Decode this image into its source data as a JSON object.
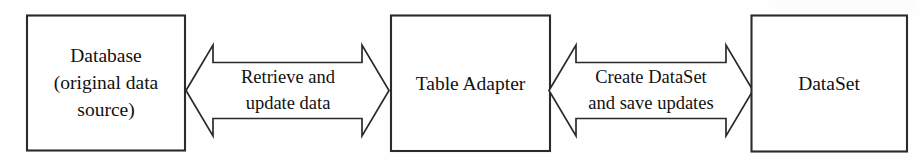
{
  "diagram": {
    "type": "block-flow",
    "orientation": "horizontal",
    "colors": {
      "background": "#fefefe",
      "shape_fill": "#ffffff",
      "stroke": "#2b2b2b",
      "text": "#111111"
    },
    "nodes": [
      {
        "id": "database",
        "lines": [
          "Database",
          "(original data",
          "source)"
        ],
        "line1": "Database",
        "line2": "(original data",
        "line3": "source)"
      },
      {
        "id": "table-adapter",
        "lines": [
          "Table Adapter"
        ],
        "line1": "Table Adapter"
      },
      {
        "id": "dataset",
        "lines": [
          "DataSet"
        ],
        "line1": "DataSet"
      }
    ],
    "connectors": [
      {
        "id": "database-to-adapter",
        "style": "double-headed-arrow",
        "from": "database",
        "to": "table-adapter",
        "lines": [
          "Retrieve and",
          "update data"
        ],
        "line1": "Retrieve and",
        "line2": "update data"
      },
      {
        "id": "adapter-to-dataset",
        "style": "double-headed-arrow",
        "from": "table-adapter",
        "to": "dataset",
        "lines": [
          "Create DataSet",
          "and save updates"
        ],
        "line1": "Create DataSet",
        "line2": "and save updates"
      }
    ]
  }
}
